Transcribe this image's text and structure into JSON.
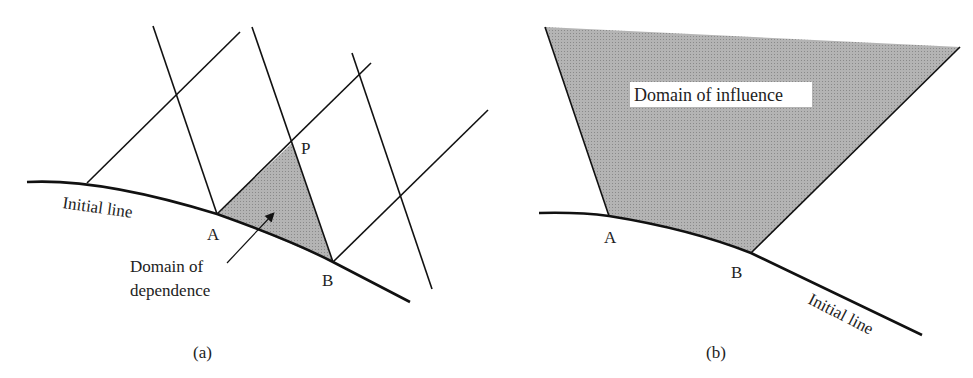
{
  "colors": {
    "line": "#111111",
    "shade": "#a9a9a9",
    "label_bg": "#ffffff",
    "text": "#222222"
  },
  "panel_a": {
    "caption": "(a)",
    "initial_line_label": "Initial line",
    "point_a": "A",
    "point_b": "B",
    "point_p": "P",
    "annotation_line1": "Domain of",
    "annotation_line2": "dependence"
  },
  "panel_b": {
    "caption": "(b)",
    "initial_line_label": "Initial line",
    "point_a": "A",
    "point_b": "B",
    "region_label": "Domain of influence"
  }
}
